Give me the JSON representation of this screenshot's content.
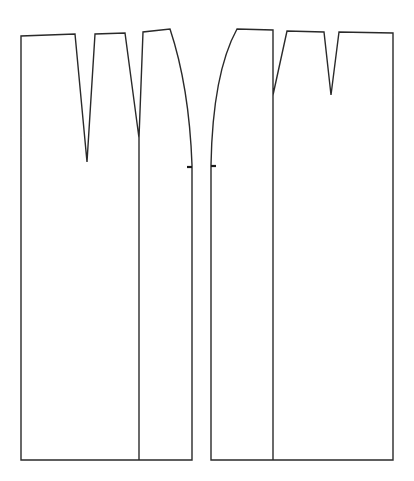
{
  "diagram": {
    "type": "sewing-pattern",
    "colors": {
      "background": "#ffffff",
      "line": "#2a2a2a"
    },
    "pieces": [
      {
        "name": "left-panel",
        "darts": 2,
        "notch": "side-seam"
      },
      {
        "name": "right-panel",
        "darts": 2,
        "notch": "side-seam"
      }
    ]
  }
}
